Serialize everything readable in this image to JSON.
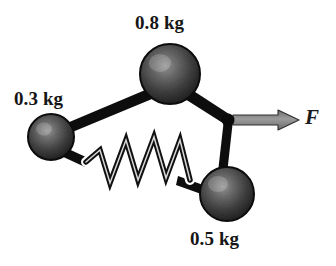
{
  "figure": {
    "background_color": "#ffffff",
    "width": 336,
    "height": 266
  },
  "labels": {
    "mass_small": "0.3 kg",
    "mass_large": "0.8 kg",
    "mass_medium": "0.5 kg",
    "force": "F"
  },
  "diagram_data": {
    "type": "physics-free-body-diagram",
    "masses": [
      {
        "name": "mass-0.3kg",
        "label": "0.3 kg",
        "value": 0.3,
        "unit": "kg",
        "cx": 51,
        "cy": 137,
        "r": 23,
        "label_position": "above-left"
      },
      {
        "name": "mass-0.8kg",
        "label": "0.8 kg",
        "value": 0.8,
        "unit": "kg",
        "cx": 170,
        "cy": 74,
        "r": 30,
        "label_position": "above"
      },
      {
        "name": "mass-0.5kg",
        "label": "0.5 kg",
        "value": 0.5,
        "unit": "kg",
        "cx": 227,
        "cy": 194,
        "r": 27,
        "label_position": "below"
      }
    ],
    "junction": {
      "name": "junction-node",
      "cx": 228,
      "cy": 120,
      "r": 6
    },
    "rods": [
      {
        "name": "rod-0.3kg-to-0.8kg",
        "from": "mass-0.3kg",
        "to": "mass-0.8kg",
        "x1": 70,
        "y1": 128,
        "x2": 148,
        "y2": 95
      },
      {
        "name": "rod-0.8kg-to-junction",
        "from": "mass-0.8kg",
        "to": "junction-node",
        "x1": 192,
        "y1": 95,
        "x2": 228,
        "y2": 120
      },
      {
        "name": "rod-junction-to-0.5kg",
        "from": "junction-node",
        "to": "mass-0.5kg",
        "x1": 228,
        "y1": 120,
        "x2": 222,
        "y2": 170
      }
    ],
    "spring": {
      "name": "spring-0.3kg-to-0.5kg",
      "from": "mass-0.3kg",
      "to": "mass-0.5kg",
      "x1": 72,
      "y1": 152,
      "x2": 202,
      "y2": 188,
      "coils": 5,
      "style": "zigzag"
    },
    "force_arrow": {
      "name": "force-arrow",
      "label": "F",
      "from": "junction-node",
      "x1": 234,
      "y1": 120,
      "x2": 298,
      "y2": 120,
      "direction": "right",
      "color": "#8a8a8a"
    },
    "colors": {
      "sphere_fill": "#3a3a3a",
      "sphere_edge": "#121212",
      "sphere_highlight": "#8d8d8d",
      "rod": "#0d0d0d",
      "spring_fill": "#f2f2f2",
      "spring_stroke": "#111111",
      "arrow": "#8a8a8a",
      "arrow_outline": "#2b2b2b",
      "text": "#151515",
      "background": "#ffffff"
    }
  }
}
